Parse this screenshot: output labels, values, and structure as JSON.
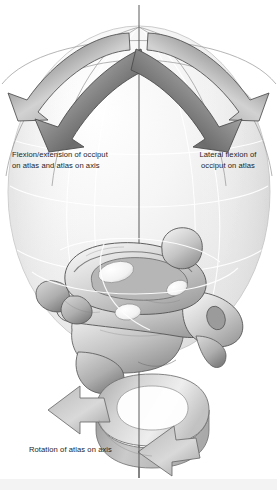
{
  "figure": {
    "width": 277,
    "height": 490,
    "background": "#ffffff"
  },
  "captions": {
    "left": "Flexion/extension of occiput\non atlas and atlas on axis",
    "right": "Lateral flexion of\nocciput on atlas",
    "bottom": "Rotation of atlas on axis"
  },
  "colors": {
    "text": "#1d1d1d",
    "arrow_dark": "#6e6e6e",
    "arrow_mid": "#9a9a9a",
    "arrow_light": "#d8d8d8",
    "arrow_outline": "#4a4a4a",
    "sphere_light": "#fdfdfd",
    "sphere_mid": "#ececec",
    "sphere_shadow": "#d6d6d6",
    "wire_line": "#ffffff",
    "axis_line": "#5a5a5a",
    "bone_light": "#f2f2f2",
    "bone_mid": "#c9c9c9",
    "bone_dark": "#8d8d8d",
    "bone_outline": "#555555",
    "bottom_band": "#f3f3f3"
  },
  "elements": {
    "sphere_label": "motion-sphere",
    "axis_label": "vertical-axis-line",
    "vertebrae_label": "atlas-axis-vertebrae",
    "arrow_flexion_outer": "flexion-extension-arrow-outer-left",
    "arrow_flexion_inner": "flexion-extension-arrow-inner-left",
    "arrow_lateral_outer": "lateral-flexion-arrow-outer-right",
    "arrow_lateral_inner": "lateral-flexion-arrow-inner-right",
    "arrow_rotation": "rotation-ribbon-arrow"
  }
}
